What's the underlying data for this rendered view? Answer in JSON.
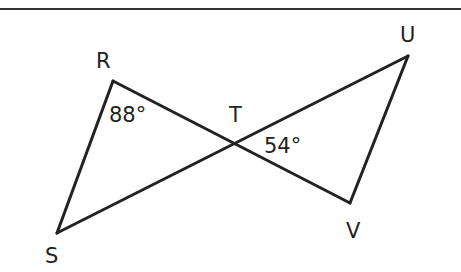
{
  "diagram": {
    "type": "two triangles sharing vertex T (bowtie)",
    "stroke_color": "#222222",
    "top_rule_color": "#333333",
    "points": {
      "R": {
        "label": "R",
        "x": 113,
        "y": 81
      },
      "S": {
        "label": "S",
        "x": 57,
        "y": 233
      },
      "T": {
        "label": "T",
        "x": 234,
        "y": 143
      },
      "U": {
        "label": "U",
        "x": 408,
        "y": 56
      },
      "V": {
        "label": "V",
        "x": 350,
        "y": 203
      }
    },
    "segments": [
      "RS",
      "RV",
      "SU",
      "UV"
    ],
    "angles": {
      "R": {
        "label": "88°",
        "vertex": "R"
      },
      "T": {
        "label": "54°",
        "vertex": "T",
        "between": "TU and TV"
      }
    }
  }
}
